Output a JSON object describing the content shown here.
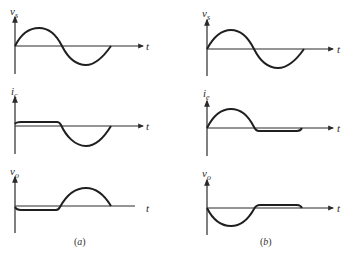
{
  "figure": {
    "stroke_color": "#1f1f1f",
    "axis_color": "#3a3a3a",
    "panels": [
      {
        "id": "a",
        "caption": "(a)",
        "caption_letter": "a",
        "plots": [
          {
            "name": "vs-plot",
            "y_label_main": "v",
            "y_label_sub": "s",
            "x_label": "t",
            "waveform": "full sine"
          },
          {
            "name": "ic-plot",
            "y_label_main": "i",
            "y_label_sub": "c",
            "x_label": "t",
            "waveform": "flat near zero then negative half-sine"
          },
          {
            "name": "vo-plot",
            "y_label_main": "v",
            "y_label_sub": "o",
            "x_label": "t",
            "waveform": "flat slightly negative then positive half-sine"
          }
        ]
      },
      {
        "id": "b",
        "caption": "(b)",
        "caption_letter": "b",
        "plots": [
          {
            "name": "vs-plot",
            "y_label_main": "v",
            "y_label_sub": "s",
            "x_label": "t",
            "waveform": "full sine"
          },
          {
            "name": "ie-plot",
            "y_label_main": "i",
            "y_label_sub": "e",
            "x_label": "t",
            "waveform": "positive half-sine then flat slightly negative"
          },
          {
            "name": "vo-plot",
            "y_label_main": "v",
            "y_label_sub": "o",
            "x_label": "t",
            "waveform": "negative half-sine then flat slightly positive"
          }
        ]
      }
    ]
  }
}
